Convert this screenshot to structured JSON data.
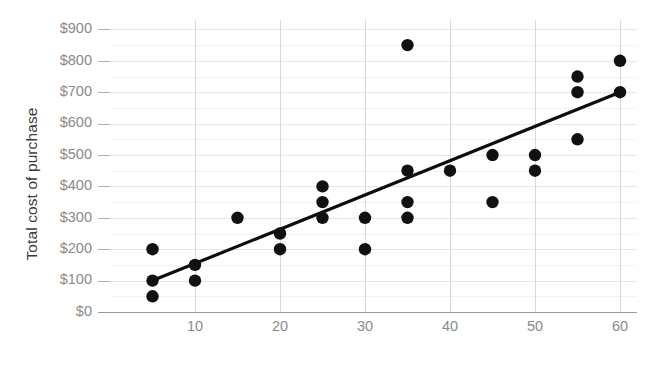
{
  "chart_data": {
    "type": "scatter",
    "title": "",
    "xlabel": "",
    "ylabel": "Total cost of purchase",
    "xlim": [
      0,
      62
    ],
    "ylim": [
      0,
      930
    ],
    "grid": true,
    "legend": "none",
    "x_ticks": [
      10,
      20,
      30,
      40,
      50,
      60
    ],
    "x_tick_labels": [
      "10",
      "20",
      "30",
      "40",
      "50",
      "60"
    ],
    "y_ticks": [
      0,
      100,
      200,
      300,
      400,
      500,
      600,
      700,
      800,
      900
    ],
    "y_tick_labels": [
      "$0",
      "$100",
      "$200",
      "$300",
      "$400",
      "$500",
      "$600",
      "$700",
      "$800",
      "$900"
    ],
    "point_color": "#111111",
    "gridline_color": "#e6e6e6",
    "axis_color": "#9a9a9a",
    "tick_label_color": "#8a8a8a",
    "axis_title_color": "#3c3c3c",
    "points": [
      {
        "x": 5,
        "y": 200
      },
      {
        "x": 5,
        "y": 100
      },
      {
        "x": 5,
        "y": 50
      },
      {
        "x": 10,
        "y": 150
      },
      {
        "x": 10,
        "y": 100
      },
      {
        "x": 15,
        "y": 300
      },
      {
        "x": 20,
        "y": 250
      },
      {
        "x": 20,
        "y": 200
      },
      {
        "x": 25,
        "y": 400
      },
      {
        "x": 25,
        "y": 350
      },
      {
        "x": 25,
        "y": 300
      },
      {
        "x": 30,
        "y": 300
      },
      {
        "x": 30,
        "y": 200
      },
      {
        "x": 35,
        "y": 850
      },
      {
        "x": 35,
        "y": 450
      },
      {
        "x": 35,
        "y": 350
      },
      {
        "x": 35,
        "y": 300
      },
      {
        "x": 40,
        "y": 450
      },
      {
        "x": 45,
        "y": 500
      },
      {
        "x": 45,
        "y": 350
      },
      {
        "x": 50,
        "y": 500
      },
      {
        "x": 50,
        "y": 450
      },
      {
        "x": 55,
        "y": 750
      },
      {
        "x": 55,
        "y": 700
      },
      {
        "x": 55,
        "y": 550
      },
      {
        "x": 60,
        "y": 800
      },
      {
        "x": 60,
        "y": 700
      }
    ],
    "trend_line": {
      "name": "trend-line",
      "color": "#0d0d0d",
      "x_start": 5,
      "y_start": 100,
      "x_end": 60,
      "y_end": 700
    }
  }
}
